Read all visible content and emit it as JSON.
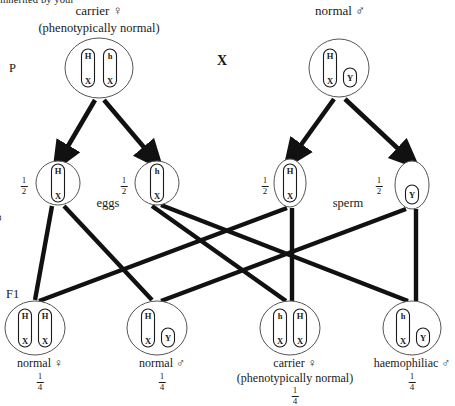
{
  "diagram": {
    "title_cut_off": "inherited by your",
    "cross_symbol": "X",
    "stage_labels": {
      "parent": "P",
      "gametes": "gametes",
      "f1": "F1"
    },
    "gamete_pool_labels": {
      "eggs": "eggs",
      "sperm": "sperm"
    },
    "symbols": {
      "female": "♀",
      "male": "♂"
    },
    "parents": [
      {
        "name": "mother",
        "title": "carrier ♀",
        "subtitle": "(phenotypically normal)",
        "cx": 99,
        "cy": 68,
        "rx": 34,
        "ry": 30,
        "chromosomes": [
          {
            "top": "H",
            "bottom": "X",
            "long": true,
            "dx": -11
          },
          {
            "top": "h",
            "bottom": "X",
            "long": true,
            "dx": 11
          }
        ]
      },
      {
        "name": "father",
        "title": "normal ♂",
        "subtitle": "",
        "cx": 339,
        "cy": 68,
        "rx": 30,
        "ry": 29,
        "chromosomes": [
          {
            "top": "H",
            "bottom": "X",
            "long": true,
            "dx": -9
          },
          {
            "top": "",
            "bottom": "Y",
            "long": false,
            "dx": 11
          }
        ]
      }
    ],
    "gametes": [
      {
        "name": "egg-H-X",
        "pool": "eggs",
        "fraction_num": "1",
        "fraction_den": "2",
        "cx": 58,
        "cy": 183,
        "rx": 22,
        "ry": 22,
        "chromosomes": [
          {
            "top": "H",
            "bottom": "X",
            "long": true,
            "dx": 0
          }
        ]
      },
      {
        "name": "egg-h-X",
        "pool": "eggs",
        "fraction_num": "1",
        "fraction_den": "2",
        "cx": 157,
        "cy": 183,
        "rx": 22,
        "ry": 22,
        "chromosomes": [
          {
            "top": "h",
            "bottom": "X",
            "long": true,
            "dx": 0
          }
        ]
      },
      {
        "name": "sperm-H-X",
        "pool": "sperm",
        "fraction_num": "1",
        "fraction_den": "2",
        "cx": 290,
        "cy": 183,
        "rx": 16,
        "ry": 24,
        "chromosomes": [
          {
            "top": "H",
            "bottom": "X",
            "long": true,
            "dx": 0
          }
        ]
      },
      {
        "name": "sperm-Y",
        "pool": "sperm",
        "fraction_num": "1",
        "fraction_den": "2",
        "cx": 412,
        "cy": 185,
        "rx": 17,
        "ry": 24,
        "chromosomes": [
          {
            "top": "",
            "bottom": "Y",
            "long": false,
            "dx": 0
          }
        ]
      }
    ],
    "offspring": [
      {
        "name": "f1-normal-female",
        "label": "normal ♀",
        "sublabel": "",
        "fraction_num": "1",
        "fraction_den": "4",
        "cx": 35,
        "cy": 328,
        "rx": 30,
        "ry": 27,
        "chromosomes": [
          {
            "top": "H",
            "bottom": "X",
            "long": true,
            "dx": -10
          },
          {
            "top": "H",
            "bottom": "X",
            "long": true,
            "dx": 10
          }
        ]
      },
      {
        "name": "f1-normal-male",
        "label": "normal ♂",
        "sublabel": "",
        "fraction_num": "1",
        "fraction_den": "4",
        "cx": 157,
        "cy": 328,
        "rx": 30,
        "ry": 27,
        "chromosomes": [
          {
            "top": "H",
            "bottom": "X",
            "long": true,
            "dx": -9
          },
          {
            "top": "",
            "bottom": "Y",
            "long": false,
            "dx": 11
          }
        ]
      },
      {
        "name": "f1-carrier-female",
        "label": "carrier ♀",
        "sublabel": "(phenotypically normal)",
        "fraction_num": "1",
        "fraction_den": "4",
        "cx": 290,
        "cy": 328,
        "rx": 30,
        "ry": 27,
        "chromosomes": [
          {
            "top": "h",
            "bottom": "X",
            "long": true,
            "dx": -10
          },
          {
            "top": "H",
            "bottom": "X",
            "long": true,
            "dx": 10
          }
        ]
      },
      {
        "name": "f1-haemophiliac-male",
        "label": "haemophiliac ♂",
        "sublabel": "",
        "fraction_num": "1",
        "fraction_den": "4",
        "cx": 412,
        "cy": 328,
        "rx": 29,
        "ry": 27,
        "chromosomes": [
          {
            "top": "h",
            "bottom": "X",
            "long": true,
            "dx": -9
          },
          {
            "top": "",
            "bottom": "Y",
            "long": false,
            "dx": 11
          }
        ]
      }
    ],
    "colors": {
      "ink": "#1a1a1a",
      "outline": "#555555",
      "background": "#ffffff"
    }
  }
}
